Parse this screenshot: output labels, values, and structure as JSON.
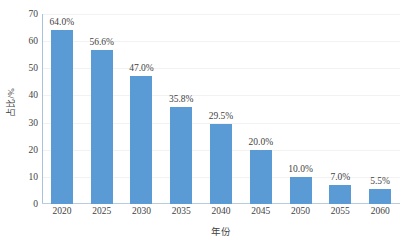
{
  "chart_data": {
    "type": "bar",
    "title": "",
    "categories": [
      "2020",
      "2025",
      "2030",
      "2035",
      "2040",
      "2045",
      "2050",
      "2055",
      "2060"
    ],
    "values": [
      64.0,
      56.6,
      47.0,
      35.8,
      29.5,
      20.0,
      10.0,
      7.0,
      5.5
    ],
    "data_labels": [
      "64.0%",
      "56.6%",
      "47.0%",
      "35.8%",
      "29.5%",
      "20.0%",
      "10.0%",
      "7.0%",
      "5.5%"
    ],
    "xlabel": "年份",
    "ylabel": "占比/%",
    "ylim": [
      0,
      70
    ],
    "yticks": [
      0,
      10,
      20,
      30,
      40,
      50,
      60,
      70
    ],
    "ytick_labels": [
      "0",
      "10",
      "20",
      "30",
      "40",
      "50",
      "60",
      "70"
    ],
    "grid": true,
    "legend": "none",
    "series": [
      {
        "name": "占比",
        "color": "#5b9bd5",
        "values": [
          64.0,
          56.6,
          47.0,
          35.8,
          29.5,
          20.0,
          10.0,
          7.0,
          5.5
        ]
      }
    ]
  },
  "colors": {
    "bar": "#5b9bd5",
    "grid": "#f2f2f2",
    "axis": "#b8cde0",
    "text": "#3f3f3f",
    "background": "#ffffff"
  }
}
